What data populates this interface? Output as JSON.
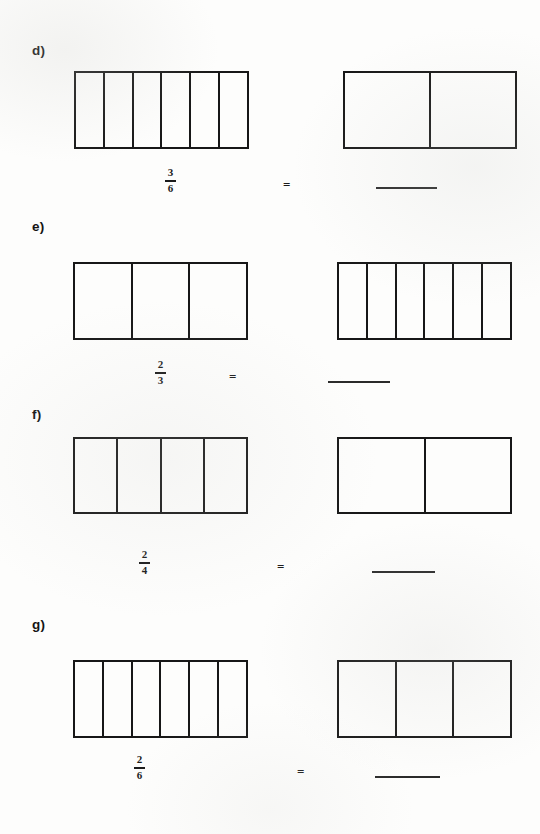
{
  "document": {
    "type": "math-worksheet",
    "topic": "equivalent-fractions",
    "background_color": "#fdfdfc",
    "ink_color": "#171717"
  },
  "problems": [
    {
      "label": "d)",
      "left_model": {
        "parts": 6,
        "shaded": 0
      },
      "fraction": {
        "numerator": "3",
        "denominator": "6"
      },
      "operator": "=",
      "right_model": {
        "parts": 2,
        "shaded": 0
      },
      "answer": ""
    },
    {
      "label": "e)",
      "left_model": {
        "parts": 3,
        "shaded": 0
      },
      "fraction": {
        "numerator": "2",
        "denominator": "3"
      },
      "operator": "=",
      "right_model": {
        "parts": 6,
        "shaded": 0
      },
      "answer": ""
    },
    {
      "label": "f)",
      "left_model": {
        "parts": 4,
        "shaded": 0
      },
      "fraction": {
        "numerator": "2",
        "denominator": "4"
      },
      "operator": "=",
      "right_model": {
        "parts": 2,
        "shaded": 0
      },
      "answer": ""
    },
    {
      "label": "g)",
      "left_model": {
        "parts": 6,
        "shaded": 0
      },
      "fraction": {
        "numerator": "2",
        "denominator": "6"
      },
      "operator": "=",
      "right_model": {
        "parts": 3,
        "shaded": 0
      },
      "answer": ""
    }
  ]
}
